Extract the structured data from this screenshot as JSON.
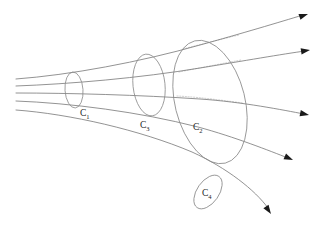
{
  "figure": {
    "background_color": "#ffffff",
    "line_color": "#6f6f6f",
    "hidden_line_color": "#b9b9b9",
    "curve_color": "#8a8a8a",
    "arrow_color": "#1a1a1a",
    "label_color": "#1d1d1d"
  },
  "cross_sections": [
    {
      "id": "c1",
      "base": "C",
      "subscript": "1",
      "label": "C1",
      "center_x": 74,
      "center_y": 90,
      "radius_x": 9,
      "radius_y": 18,
      "rotation_deg": -4,
      "label_x": 80,
      "label_y": 116
    },
    {
      "id": "c3",
      "base": "C",
      "subscript": "3",
      "label": "C3",
      "center_x": 149,
      "center_y": 85,
      "radius_x": 16,
      "radius_y": 31,
      "rotation_deg": -6,
      "label_x": 140,
      "label_y": 128
    },
    {
      "id": "c2",
      "base": "C",
      "subscript": "2",
      "label": "C2",
      "center_x": 210,
      "center_y": 102,
      "radius_x": 35,
      "radius_y": 63,
      "rotation_deg": -14,
      "label_x": 193,
      "label_y": 130
    },
    {
      "id": "c4",
      "base": "C",
      "subscript": "4",
      "label": "C4",
      "center_x": 208,
      "center_y": 192,
      "radius_x": 11,
      "radius_y": 19,
      "rotation_deg": 35,
      "label_x": 202,
      "label_y": 196
    }
  ],
  "stream_lines": [
    {
      "id": "stream-1",
      "path": "M 16 79 C 70 75, 140 62, 200 45 C 240 34, 280 22, 303 15",
      "arrow_tip_x": 308,
      "arrow_tip_y": 14,
      "arrow_angle_deg": -19
    },
    {
      "id": "stream-2",
      "path": "M 16 86 C 70 84, 140 78, 200 68 C 243 61, 283 54, 305 51",
      "arrow_tip_x": 310,
      "arrow_tip_y": 50,
      "arrow_angle_deg": -9
    },
    {
      "id": "stream-3",
      "path": "M 16 93 C 70 93, 140 95, 200 99 C 243 102, 283 110, 304 114",
      "arrow_tip_x": 309,
      "arrow_tip_y": 115,
      "arrow_angle_deg": 12
    },
    {
      "id": "stream-4",
      "path": "M 16 101 C 70 103, 140 112, 198 127 C 235 137, 270 151, 288 158",
      "arrow_tip_x": 293,
      "arrow_tip_y": 160,
      "arrow_angle_deg": 24
    },
    {
      "id": "stream-5",
      "path": "M 16 110 C 70 114, 140 130, 192 152 C 227 168, 255 190, 268 208",
      "arrow_tip_x": 271,
      "arrow_tip_y": 214,
      "arrow_angle_deg": 56
    }
  ],
  "hidden_segments": [
    {
      "id": "hidden-1",
      "path": "M 183 49 C 202 44, 222 39, 239 35"
    },
    {
      "id": "hidden-2",
      "path": "M 179 72 C 199 68, 220 64, 241 60"
    },
    {
      "id": "hidden-3",
      "path": "M 177 96 C 198 97, 220 100, 243 103"
    }
  ]
}
